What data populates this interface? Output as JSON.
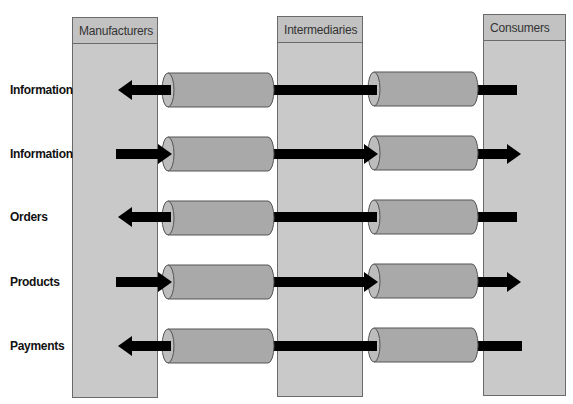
{
  "diagram": {
    "colors": {
      "column_fill": "#c9c9c9",
      "header_fill": "#c2c2c2",
      "column_border": "#6a6a6a",
      "cylinder_fill": "#a9a9a9",
      "cylinder_cap": "#bdbdbd",
      "cylinder_stroke": "#555555",
      "arrow": "#000000"
    },
    "columns": [
      {
        "id": "manufacturers",
        "label": "Manufacturers",
        "x": 72,
        "y": 17,
        "width": 86,
        "height": 381
      },
      {
        "id": "intermediaries",
        "label": "Intermediaries",
        "x": 277,
        "y": 16,
        "width": 86,
        "height": 381
      },
      {
        "id": "consumers",
        "label": "Consumers",
        "x": 483,
        "y": 14,
        "width": 83,
        "height": 382
      }
    ],
    "rows": [
      {
        "label": "Information",
        "y": 90,
        "direction": "left",
        "arrow_start": 118,
        "arrow_end": 517,
        "cylinders": [
          {
            "x": 162,
            "width": 112,
            "y": 73,
            "height": 34
          },
          {
            "x": 368,
            "width": 110,
            "y": 72,
            "height": 34
          }
        ]
      },
      {
        "label": "Information",
        "y": 154,
        "direction": "right",
        "arrow_start": 116,
        "arrow_end": 521,
        "cylinders": [
          {
            "x": 162,
            "width": 112,
            "y": 137,
            "height": 34
          },
          {
            "x": 368,
            "width": 110,
            "y": 136,
            "height": 34
          }
        ]
      },
      {
        "label": "Orders",
        "y": 217,
        "direction": "left",
        "arrow_start": 118,
        "arrow_end": 517,
        "cylinders": [
          {
            "x": 162,
            "width": 112,
            "y": 201,
            "height": 34
          },
          {
            "x": 368,
            "width": 110,
            "y": 200,
            "height": 34
          }
        ]
      },
      {
        "label": "Products",
        "y": 282,
        "direction": "right",
        "arrow_start": 116,
        "arrow_end": 521,
        "cylinders": [
          {
            "x": 162,
            "width": 112,
            "y": 265,
            "height": 34
          },
          {
            "x": 368,
            "width": 110,
            "y": 264,
            "height": 34
          }
        ]
      },
      {
        "label": "Payments",
        "y": 346,
        "direction": "left",
        "arrow_start": 118,
        "arrow_end": 522,
        "cylinders": [
          {
            "x": 162,
            "width": 112,
            "y": 329,
            "height": 34
          },
          {
            "x": 368,
            "width": 110,
            "y": 328,
            "height": 34
          }
        ]
      }
    ]
  }
}
